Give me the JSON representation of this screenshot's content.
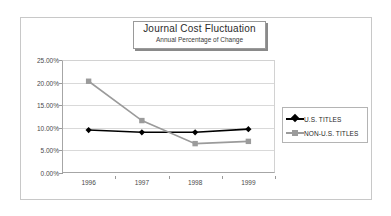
{
  "chart_data": {
    "type": "line",
    "title": "Journal Cost Fluctuation",
    "subtitle": "Annual Percentage of Change",
    "xlabel": "",
    "ylabel": "",
    "categories": [
      "1996",
      "1997",
      "1998",
      "1999"
    ],
    "series": [
      {
        "name": "U.S. TITLES",
        "values": [
          9.5,
          9.0,
          9.0,
          9.7
        ],
        "color": "#000000",
        "marker": "diamond"
      },
      {
        "name": "NON-U.S. TITLES",
        "values": [
          20.3,
          11.6,
          6.5,
          7.0
        ],
        "color": "#9b9b9b",
        "marker": "square"
      }
    ],
    "ylim": [
      0,
      25
    ],
    "ytick_values": [
      0,
      5,
      10,
      15,
      20,
      25
    ],
    "ytick_labels": [
      "0.00%",
      "5.00%",
      "10.00%",
      "15.00%",
      "20.00%",
      "25.00%"
    ],
    "grid": true,
    "legend_position": "right"
  },
  "legend": {
    "items": [
      {
        "label": "U.S. TITLES"
      },
      {
        "label": "NON-U.S. TITLES"
      }
    ]
  }
}
